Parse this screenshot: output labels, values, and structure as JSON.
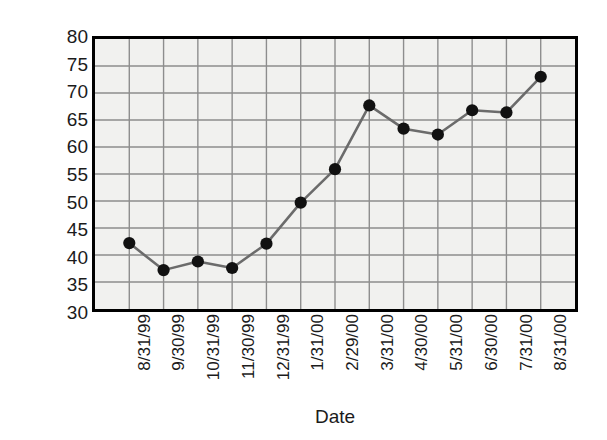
{
  "chart_data": {
    "type": "line",
    "title": "",
    "xlabel": "Date",
    "ylabel": "Closing price",
    "categories": [
      "8/31/99",
      "9/30/99",
      "10/31/99",
      "11/30/99",
      "12/31/99",
      "1/31/00",
      "2/29/00",
      "3/31/00",
      "4/30/00",
      "5/31/00",
      "6/30/00",
      "7/31/00",
      "8/31/00"
    ],
    "values": [
      42.2,
      37.2,
      38.8,
      37.6,
      42.1,
      49.7,
      55.9,
      67.7,
      63.4,
      62.3,
      66.8,
      66.4,
      73.0
    ],
    "ylim": [
      30,
      80
    ],
    "yticks": [
      30,
      35,
      40,
      45,
      50,
      55,
      60,
      65,
      70,
      75,
      80
    ],
    "grid": true,
    "legend": "none",
    "marker": "filled-circle",
    "colors": {
      "line": "#6b6b6b",
      "marker": "#111111",
      "grid": "#8d8d8d",
      "plot_background": "#f1f1ef",
      "frame": "#000000",
      "text": "#1b1b1b"
    }
  }
}
